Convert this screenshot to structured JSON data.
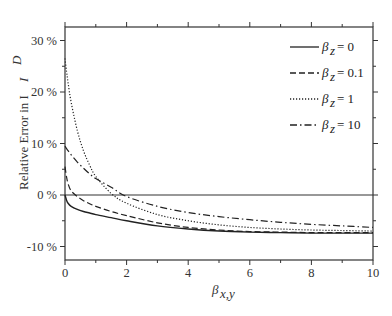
{
  "chart_data": {
    "type": "line",
    "title": "",
    "xlabel": "β_{x,y}",
    "ylabel": "Relative Error in I^D",
    "xlim": [
      0,
      10
    ],
    "ylim": [
      -12.5,
      32.5
    ],
    "x_ticks": [
      0,
      2,
      4,
      6,
      8,
      10
    ],
    "x_tick_labels": [
      "0",
      "2",
      "4",
      "6",
      "8",
      "10"
    ],
    "y_ticks": [
      -10,
      0,
      10,
      20,
      30
    ],
    "y_tick_labels": [
      "-10 %",
      "0 %",
      "10 %",
      "20 %",
      "30 %"
    ],
    "grid": false,
    "reference_line": {
      "y": 0,
      "style": "solid"
    },
    "legend_position": "upper right",
    "x": [
      0,
      0.05,
      0.1,
      0.2,
      0.4,
      0.6,
      0.8,
      1.0,
      1.5,
      2,
      3,
      4,
      5,
      6,
      7,
      8,
      9,
      10
    ],
    "series": [
      {
        "name": "β_z = 0",
        "style": "solid",
        "values": [
          0,
          -1.0,
          -1.6,
          -2.2,
          -2.8,
          -3.2,
          -3.5,
          -3.8,
          -4.4,
          -5.0,
          -6.0,
          -6.6,
          -7.0,
          -7.2,
          -7.3,
          -7.4,
          -7.4,
          -7.4
        ]
      },
      {
        "name": "β_z = 0.1",
        "style": "dashed",
        "values": [
          5.5,
          3.5,
          2.2,
          0.8,
          -0.3,
          -1.1,
          -1.7,
          -2.2,
          -3.2,
          -4.0,
          -5.4,
          -6.3,
          -6.8,
          -7.1,
          -7.2,
          -7.3,
          -7.3,
          -7.3
        ]
      },
      {
        "name": "β_z = 1",
        "style": "dotted",
        "values": [
          26.5,
          24.0,
          21.8,
          18.0,
          12.5,
          8.6,
          5.8,
          3.6,
          0.3,
          -1.6,
          -3.8,
          -5.0,
          -5.8,
          -6.3,
          -6.6,
          -6.8,
          -6.9,
          -7.0
        ]
      },
      {
        "name": "β_z = 10",
        "style": "dash-dot",
        "values": [
          9.5,
          9.0,
          8.6,
          7.8,
          6.4,
          5.2,
          4.1,
          3.2,
          1.5,
          -0.3,
          -2.2,
          -3.4,
          -4.2,
          -4.8,
          -5.3,
          -5.7,
          -6.0,
          -6.3
        ]
      }
    ]
  },
  "labels": {
    "y_axis_title": "Relative Error in I",
    "y_axis_sup": "D",
    "x_axis_beta": "β",
    "x_axis_sub": "x,y",
    "legend_beta": "β",
    "legend_sub": "z",
    "legend_values": [
      "= 0",
      "= 0.1",
      "= 1",
      "= 10"
    ]
  }
}
